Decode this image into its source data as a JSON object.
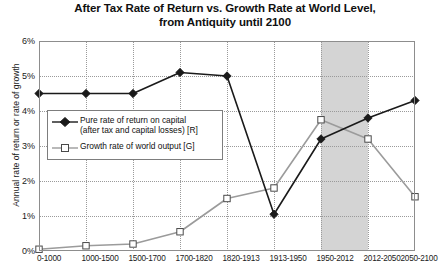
{
  "chart_data": {
    "type": "line",
    "title": "After Tax Rate of Return vs. Growth Rate at World Level, from Antiquity until 2100",
    "title_line1": "After Tax Rate of Return vs. Growth Rate at World Level,",
    "title_line2": "from Antiquity until 2100",
    "xlabel": "",
    "ylabel": "Annual rate of return or rate of growth",
    "ylim": [
      0,
      6
    ],
    "ytick_labels": [
      "0%",
      "1%",
      "2%",
      "3%",
      "4%",
      "5%",
      "6%"
    ],
    "ytick_values": [
      0,
      1,
      2,
      3,
      4,
      5,
      6
    ],
    "grid": true,
    "legend_position": "inside-left",
    "categories": [
      "0-1000",
      "1000-1500",
      "1500-1700",
      "1700-1820",
      "1820-1913",
      "1913-1950",
      "1950-2012",
      "2012-2050",
      "2050-2100"
    ],
    "series": [
      {
        "name": "Pure rate of return on capital (after tax and capital losses) [R]",
        "short_name": "R",
        "color": "#1a1a1a",
        "marker": "filled-diamond",
        "values": [
          4.5,
          4.5,
          4.5,
          5.1,
          5.0,
          1.05,
          3.2,
          3.8,
          4.3
        ]
      },
      {
        "name": "Growth rate of world output [G]",
        "short_name": "G",
        "color": "#9b9b9b",
        "marker": "open-square",
        "values": [
          0.05,
          0.15,
          0.2,
          0.55,
          1.5,
          1.8,
          3.75,
          3.2,
          1.55
        ]
      }
    ],
    "shaded_region": {
      "from_category": "1950-2012",
      "to_category": "2012-2050",
      "color": "#d4d4d4"
    }
  },
  "legend": {
    "entries": [
      {
        "line1": "Pure rate of return on capital",
        "line2": "(after tax and capital losses) [R]"
      },
      {
        "line1": "Growth rate of world output [G]",
        "line2": ""
      }
    ]
  }
}
